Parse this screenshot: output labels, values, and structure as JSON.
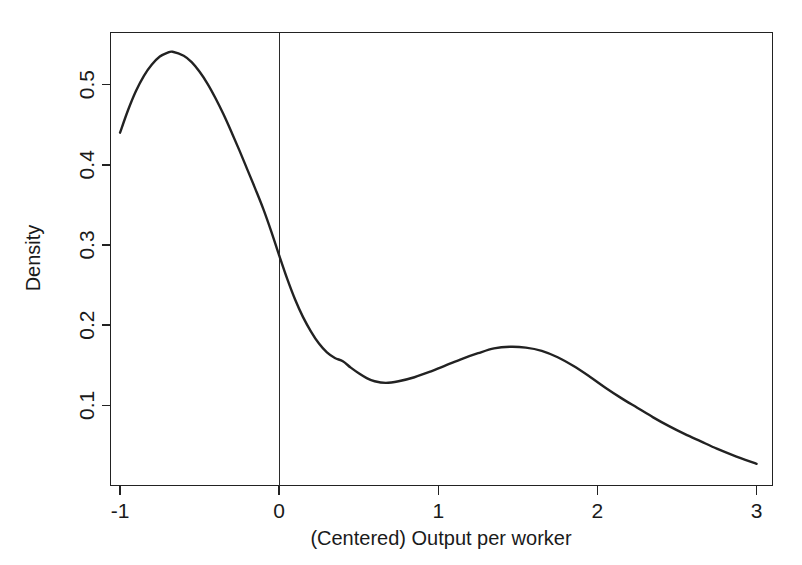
{
  "chart_data": {
    "type": "line",
    "title": "",
    "subtitle": "",
    "xlabel": "(Centered) Output per worker",
    "ylabel": "Density",
    "xlim": [
      -1.06,
      3.1
    ],
    "ylim": [
      0.0,
      0.565
    ],
    "grid": false,
    "legend": null,
    "annotations": [
      {
        "name": "zero-reference-line",
        "type": "vline",
        "x": 0,
        "label": ""
      }
    ],
    "xticks": [
      -1,
      0,
      1,
      2,
      3
    ],
    "xticklabels": [
      "-1",
      "0",
      "1",
      "2",
      "3"
    ],
    "yticks": [
      0.1,
      0.2,
      0.3,
      0.4,
      0.5
    ],
    "yticklabels": [
      "0.1",
      "0.2",
      "0.3",
      "0.4",
      "0.5"
    ],
    "series": [
      {
        "name": "density",
        "x": [
          -1.0,
          -0.95,
          -0.9,
          -0.85,
          -0.8,
          -0.75,
          -0.7,
          -0.67,
          -0.6,
          -0.55,
          -0.5,
          -0.45,
          -0.4,
          -0.35,
          -0.3,
          -0.25,
          -0.2,
          -0.15,
          -0.1,
          -0.05,
          0.0,
          0.05,
          0.1,
          0.15,
          0.2,
          0.25,
          0.3,
          0.35,
          0.4,
          0.45,
          0.5,
          0.55,
          0.6,
          0.67,
          0.75,
          0.85,
          0.95,
          1.05,
          1.15,
          1.25,
          1.35,
          1.45,
          1.55,
          1.65,
          1.75,
          1.85,
          1.95,
          2.05,
          2.15,
          2.25,
          2.35,
          2.45,
          2.55,
          2.65,
          2.75,
          2.85,
          3.0
        ],
        "y": [
          0.44,
          0.468,
          0.492,
          0.511,
          0.525,
          0.535,
          0.54,
          0.541,
          0.536,
          0.528,
          0.516,
          0.501,
          0.483,
          0.463,
          0.441,
          0.418,
          0.394,
          0.37,
          0.345,
          0.317,
          0.287,
          0.258,
          0.232,
          0.21,
          0.192,
          0.177,
          0.166,
          0.159,
          0.155,
          0.147,
          0.14,
          0.134,
          0.13,
          0.128,
          0.13,
          0.135,
          0.142,
          0.15,
          0.158,
          0.165,
          0.171,
          0.173,
          0.172,
          0.168,
          0.16,
          0.149,
          0.136,
          0.122,
          0.109,
          0.097,
          0.085,
          0.074,
          0.064,
          0.055,
          0.046,
          0.038,
          0.027
        ],
        "color": "#222222"
      }
    ]
  },
  "axes": {
    "x_title": "(Centered) Output per worker",
    "y_title": "Density"
  },
  "colors": {
    "curve": "#222222",
    "axis": "#222222",
    "background": "#ffffff",
    "reference_line": "#2b2b2b"
  }
}
